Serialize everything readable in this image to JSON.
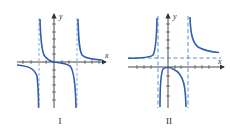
{
  "figure": {
    "colors": {
      "curve": "#2f5fb0",
      "axis": "#333333",
      "asymptote": "#3b6fc4",
      "text": "#2a2a2a"
    },
    "graphs": [
      {
        "id": "I",
        "caption": "I",
        "x_axis_label": "x",
        "y_axis_label": "y",
        "description": "Odd function with two vertical asymptotes, passing through origin with decreasing branches",
        "vertical_asymptotes": [
          "x = -a",
          "x = a"
        ],
        "horizontal_asymptote": "y = 0"
      },
      {
        "id": "II",
        "caption": "II",
        "x_axis_label": "x",
        "y_axis_label": "y",
        "description": "Even-like function with two vertical asymptotes and a horizontal asymptote above x-axis; middle branch opens downward with max at origin",
        "vertical_asymptotes": [
          "x = -a",
          "x = b"
        ],
        "horizontal_asymptote": "y = c (c > 0)"
      }
    ]
  }
}
